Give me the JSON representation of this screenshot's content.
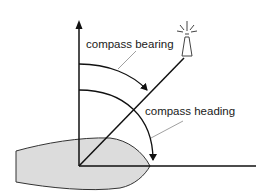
{
  "diagram": {
    "labels": {
      "bearing": "compass bearing",
      "heading": "compass heading"
    },
    "elements": {
      "north_axis": "arrow pointing north (vertical)",
      "heading_line": "boat heading line (horizontal)",
      "bearing_line": "line to lighthouse",
      "lighthouse": "lighthouse-icon",
      "boat": "boat hull seen from above"
    },
    "colors": {
      "line": "#111111",
      "hull_fill": "#dcdcdc",
      "leader": "#888888"
    }
  }
}
